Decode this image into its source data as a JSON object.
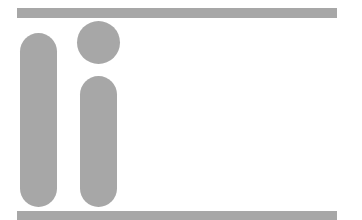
{
  "graphic": {
    "description": "abstract 'ii' logo shapes between two horizontal bars",
    "fill_color": "#a7a7a7",
    "background_color": "#ffffff",
    "shapes": [
      {
        "name": "top-bar",
        "type": "rect"
      },
      {
        "name": "left-pill",
        "type": "rounded-rect"
      },
      {
        "name": "dot",
        "type": "circle"
      },
      {
        "name": "right-pill",
        "type": "rounded-rect"
      },
      {
        "name": "bottom-bar",
        "type": "rect"
      }
    ]
  }
}
